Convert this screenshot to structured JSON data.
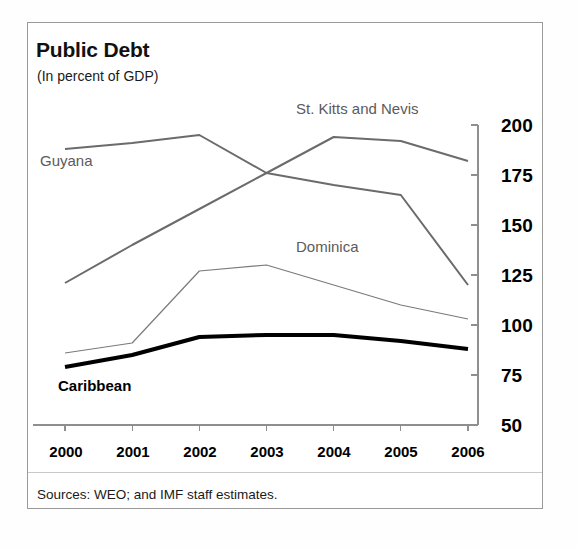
{
  "figure": {
    "title": "Public Debt",
    "subtitle": "(In percent of GDP)",
    "source_note": "Sources: WEO; and IMF staff estimates."
  },
  "axis": {
    "y_ticks": [
      "200",
      "175",
      "150",
      "125",
      "100",
      "75",
      "50"
    ],
    "x_ticks": [
      "2000",
      "2001",
      "2002",
      "2003",
      "2004",
      "2005",
      "2006"
    ]
  },
  "series_labels": {
    "st_kitts": "St. Kitts and Nevis",
    "guyana": "Guyana",
    "dominica": "Dominica",
    "caribbean": "Caribbean"
  },
  "colors": {
    "gray_line": "#6b6b6b",
    "thin_gray_line": "#7a7a7a",
    "black_line": "#000000",
    "axis": "#8f8f8f",
    "frame": "#9a9a9a",
    "text": "#111111",
    "label_gray": "#5b5b5b"
  },
  "chart_data": {
    "type": "line",
    "title": "Public Debt",
    "subtitle": "(In percent of GDP)",
    "xlabel": "",
    "ylabel": "In percent of GDP",
    "x": [
      "2000",
      "2001",
      "2002",
      "2003",
      "2004",
      "2005",
      "2006"
    ],
    "ylim": [
      50,
      200
    ],
    "yticks": [
      50,
      75,
      100,
      125,
      150,
      175,
      200
    ],
    "grid": false,
    "legend": "inline-labels",
    "series": [
      {
        "name": "St. Kitts and Nevis",
        "values": [
          121,
          140,
          158,
          176,
          194,
          192,
          182
        ],
        "color": "#6b6b6b",
        "width": 2
      },
      {
        "name": "Guyana",
        "values": [
          188,
          191,
          195,
          176,
          170,
          165,
          120
        ],
        "color": "#6b6b6b",
        "width": 2
      },
      {
        "name": "Dominica",
        "values": [
          86,
          91,
          127,
          130,
          120,
          110,
          103
        ],
        "color": "#7a7a7a",
        "width": 1.2
      },
      {
        "name": "Caribbean",
        "values": [
          79,
          85,
          94,
          95,
          95,
          92,
          88
        ],
        "color": "#000000",
        "width": 4
      }
    ],
    "source": "Sources: WEO; and IMF staff estimates."
  }
}
